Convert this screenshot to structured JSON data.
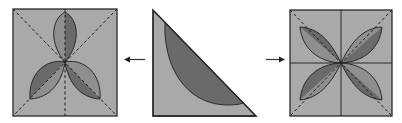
{
  "diagram": {
    "colors": {
      "background": "#ffffff",
      "paper": "#a9a9a9",
      "petal_light": "#8f8f8f",
      "petal_dark": "#6a6a6a",
      "outline": "#2a2a2a",
      "fold_line": "#1e1e1e",
      "arrow": "#333333"
    },
    "panels": [
      {
        "id": "left",
        "label": "three-petal unfolded square",
        "petals": 3,
        "fold_lines": [
          "vertical",
          "diagonal-main",
          "diagonal-anti"
        ]
      },
      {
        "id": "center",
        "label": "folded triangle with shaded curved region"
      },
      {
        "id": "right",
        "label": "four-petal unfolded square",
        "petals": 4,
        "fold_lines": [
          "vertical",
          "horizontal",
          "diagonal-main",
          "diagonal-anti"
        ]
      }
    ],
    "arrows": [
      {
        "id": "arrow-left",
        "direction": "left",
        "from": "center",
        "to": "left"
      },
      {
        "id": "arrow-right",
        "direction": "right",
        "from": "center",
        "to": "right"
      }
    ]
  }
}
